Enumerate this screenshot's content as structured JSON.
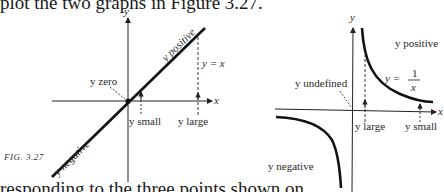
{
  "page": {
    "top_text": "plot the two graphs in Figure 3.27.",
    "bottom_text": "responding to the three points shown on"
  },
  "figure": {
    "caption": "FIG. 3.27",
    "left_graph": {
      "function": "y = x",
      "axis_x": "x",
      "axis_y": "y",
      "labels": {
        "positive": "y positive",
        "negative": "y negative",
        "zero": "y zero",
        "small": "y small",
        "large": "y large",
        "equation": "y = x"
      }
    },
    "right_graph": {
      "function": "y = 1/x",
      "axis_x": "x",
      "axis_y": "y",
      "labels": {
        "positive": "y positive",
        "negative": "y negative",
        "undefined": "y undefined",
        "large": "y large",
        "small": "y small",
        "equation_lhs": "y =",
        "equation_num": "1",
        "equation_den": "x"
      }
    }
  }
}
